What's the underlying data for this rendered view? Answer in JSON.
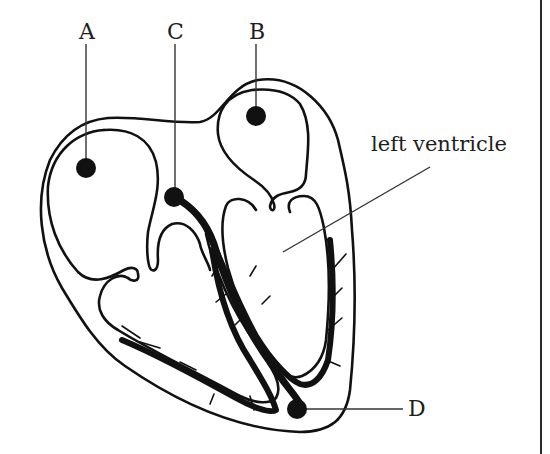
{
  "diagram": {
    "labels": {
      "A": "A",
      "B": "B",
      "C": "C",
      "D": "D",
      "left_ventricle": "left ventricle"
    },
    "markers": [
      {
        "id": "A",
        "x": 86,
        "y": 168
      },
      {
        "id": "B",
        "x": 256,
        "y": 116
      },
      {
        "id": "C",
        "x": 174,
        "y": 197
      },
      {
        "id": "D",
        "x": 297,
        "y": 409
      }
    ],
    "colors": {
      "ink": "#111111",
      "background": "#ffffff",
      "leader": "#333333"
    }
  }
}
